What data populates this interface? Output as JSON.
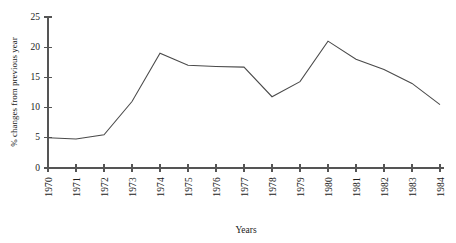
{
  "chart_data": {
    "type": "line",
    "title": "",
    "xlabel": "Years",
    "ylabel": "% changes from previous year",
    "categories": [
      "1970",
      "1971",
      "1972",
      "1973",
      "1974",
      "1975",
      "1976",
      "1977",
      "1978",
      "1979",
      "1980",
      "1981",
      "1982",
      "1983",
      "1984"
    ],
    "values": [
      5.0,
      4.8,
      5.5,
      11.0,
      19.0,
      17.0,
      16.8,
      16.7,
      11.8,
      14.3,
      21.0,
      18.0,
      16.3,
      14.0,
      10.5
    ],
    "series": [
      {
        "name": "% changes from previous year",
        "values": [
          5.0,
          4.8,
          5.5,
          11.0,
          19.0,
          17.0,
          16.8,
          16.7,
          11.8,
          14.3,
          21.0,
          18.0,
          16.3,
          14.0,
          10.5
        ]
      }
    ],
    "ylim": [
      0,
      25
    ],
    "yticks": [
      0,
      5,
      10,
      15,
      20,
      25
    ],
    "ytick_labels": [
      "0",
      "5",
      "10",
      "15",
      "20",
      "25"
    ],
    "xlim": [
      "1970",
      "1984"
    ],
    "grid": false,
    "legend": false,
    "legend_position": "none",
    "line_color": "#4a4a4a",
    "axis_color": "#555555",
    "background_color": "#ffffff",
    "xtick_rotation": 90
  }
}
